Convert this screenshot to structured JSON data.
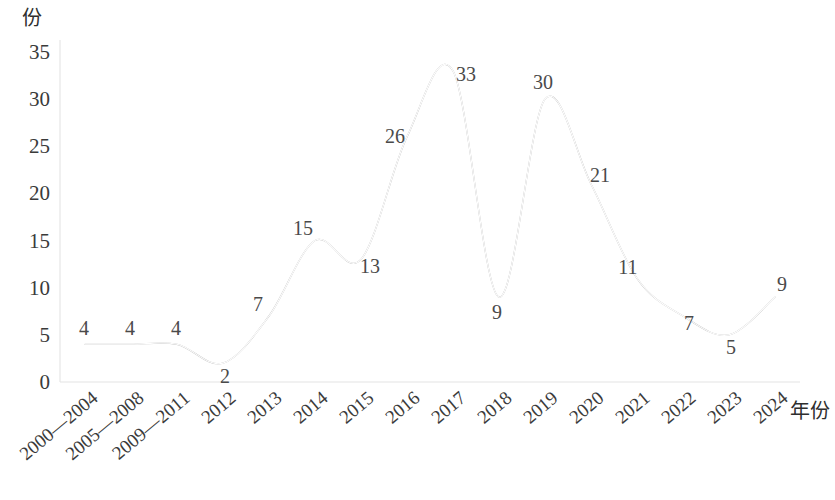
{
  "chart_data": {
    "type": "line",
    "title": "",
    "subtitle": "",
    "xlabel": "年份",
    "ylabel": "份",
    "categories": [
      "2000—2004",
      "2005—2008",
      "2009—2011",
      "2012",
      "2013",
      "2014",
      "2015",
      "2016",
      "2017",
      "2018",
      "2019",
      "2020",
      "2021",
      "2022",
      "2023",
      "2024"
    ],
    "values": [
      4,
      4,
      4,
      2,
      7,
      15,
      13,
      26,
      33,
      9,
      30,
      21,
      11,
      7,
      5,
      9
    ],
    "point_labels": [
      "4",
      "4",
      "4",
      "2",
      "7",
      "15",
      "13",
      "26",
      "33",
      "9",
      "30",
      "21",
      "11",
      "7",
      "5",
      "9"
    ],
    "ylim": [
      0,
      35
    ],
    "yticks": [
      0,
      5,
      10,
      15,
      20,
      25,
      30,
      35
    ],
    "ytick_labels": [
      "0",
      "5",
      "10",
      "15",
      "20",
      "25",
      "30",
      "35"
    ],
    "grid": false,
    "legend": null,
    "legend_position": "none",
    "smoothing": "spline",
    "series_color": "#b4b4b4",
    "axis_color": "#e4e4e4",
    "text_color": "#3a3a3a",
    "background": "#ffffff",
    "xtick_rotation_degrees": -40
  }
}
